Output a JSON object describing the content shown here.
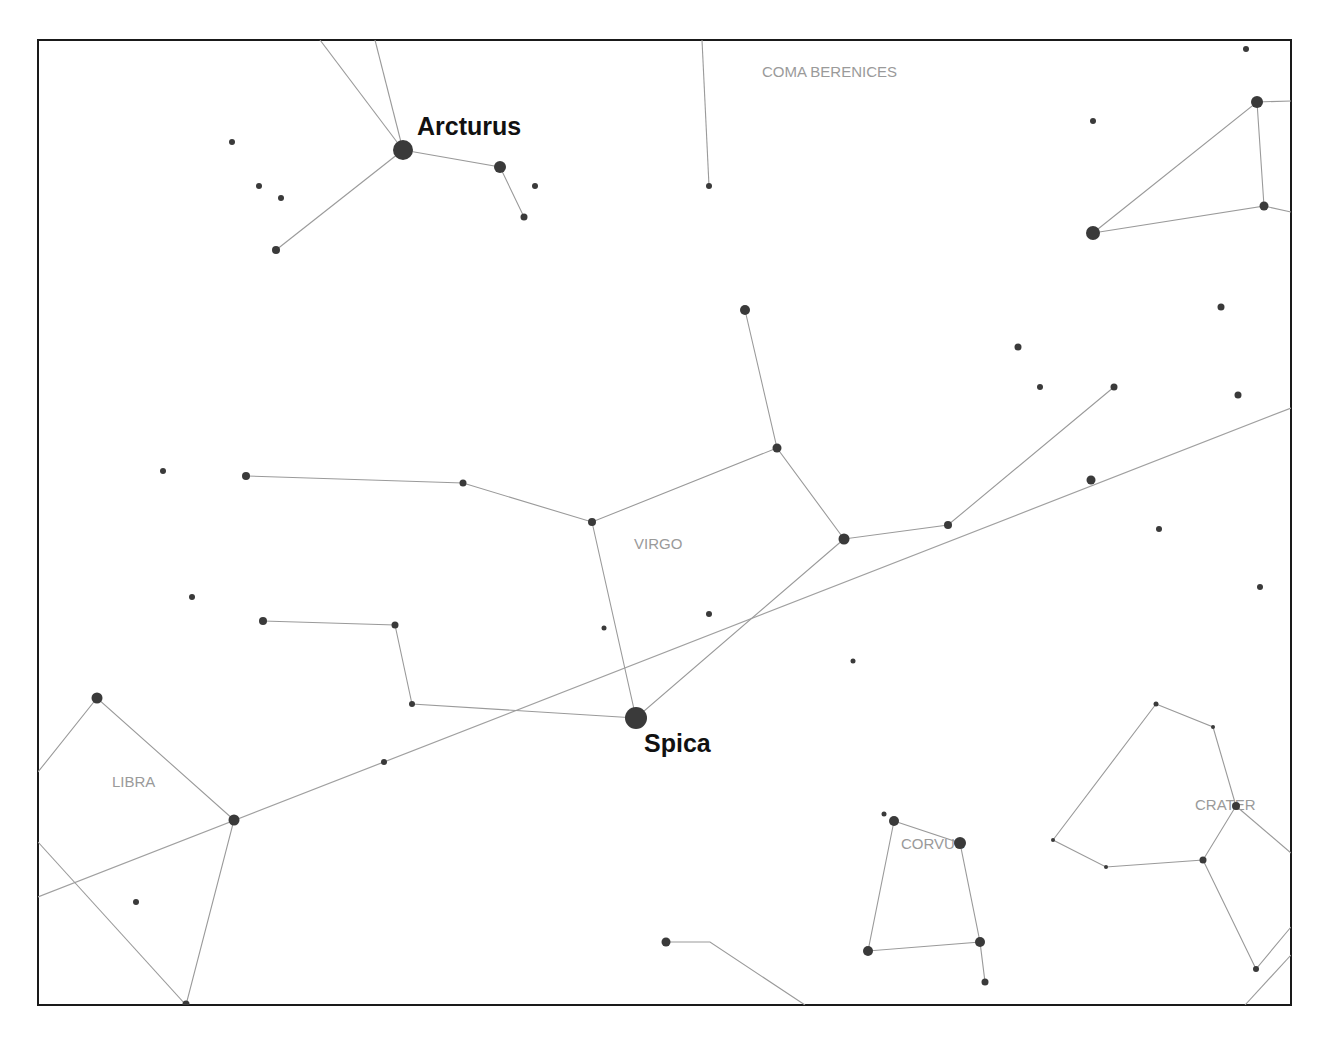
{
  "chart_data": {
    "type": "star-chart",
    "title": "",
    "frame": {
      "x": 38,
      "y": 40,
      "width": 1253,
      "height": 965
    },
    "constellation_labels": [
      {
        "name": "COMA BERENICES",
        "x": 762,
        "y": 77
      },
      {
        "name": "VIRGO",
        "x": 634,
        "y": 549
      },
      {
        "name": "LIBRA",
        "x": 112,
        "y": 787
      },
      {
        "name": "CORVUS",
        "x": 901,
        "y": 849
      },
      {
        "name": "CRATER",
        "x": 1195,
        "y": 810
      }
    ],
    "star_labels": [
      {
        "name": "Arcturus",
        "x": 417,
        "y": 135
      },
      {
        "name": "Spica",
        "x": 644,
        "y": 752
      }
    ],
    "stars": [
      {
        "id": "arcturus",
        "x": 403,
        "y": 150,
        "r": 10
      },
      {
        "x": 500,
        "y": 167,
        "r": 6
      },
      {
        "x": 524,
        "y": 217,
        "r": 3.5
      },
      {
        "x": 535,
        "y": 186,
        "r": 3
      },
      {
        "x": 276,
        "y": 250,
        "r": 4
      },
      {
        "x": 232,
        "y": 142,
        "r": 3
      },
      {
        "x": 259,
        "y": 186,
        "r": 3
      },
      {
        "x": 281,
        "y": 198,
        "r": 3
      },
      {
        "x": 709,
        "y": 186,
        "r": 3
      },
      {
        "x": 1093,
        "y": 233,
        "r": 7
      },
      {
        "x": 1257,
        "y": 102,
        "r": 6
      },
      {
        "x": 1264,
        "y": 206,
        "r": 4.5
      },
      {
        "x": 1093,
        "y": 121,
        "r": 3
      },
      {
        "x": 1246,
        "y": 49,
        "r": 3
      },
      {
        "x": 745,
        "y": 310,
        "r": 5
      },
      {
        "x": 777,
        "y": 448,
        "r": 4.5
      },
      {
        "x": 844,
        "y": 539,
        "r": 5.5
      },
      {
        "x": 948,
        "y": 525,
        "r": 4
      },
      {
        "x": 1114,
        "y": 387,
        "r": 3.5
      },
      {
        "x": 592,
        "y": 522,
        "r": 4
      },
      {
        "x": 463,
        "y": 483,
        "r": 3.5
      },
      {
        "x": 246,
        "y": 476,
        "r": 4
      },
      {
        "x": 163,
        "y": 471,
        "r": 3
      },
      {
        "x": 192,
        "y": 597,
        "r": 3
      },
      {
        "x": 263,
        "y": 621,
        "r": 4
      },
      {
        "x": 395,
        "y": 625,
        "r": 3.5
      },
      {
        "x": 412,
        "y": 704,
        "r": 3
      },
      {
        "id": "spica",
        "x": 636,
        "y": 718,
        "r": 11
      },
      {
        "x": 709,
        "y": 614,
        "r": 3
      },
      {
        "x": 604,
        "y": 628,
        "r": 2.5
      },
      {
        "x": 853,
        "y": 661,
        "r": 2.5
      },
      {
        "x": 384,
        "y": 762,
        "r": 3
      },
      {
        "x": 1018,
        "y": 347,
        "r": 3.5
      },
      {
        "x": 1040,
        "y": 387,
        "r": 3
      },
      {
        "x": 1221,
        "y": 307,
        "r": 3.5
      },
      {
        "x": 1238,
        "y": 395,
        "r": 3.5
      },
      {
        "x": 1091,
        "y": 480,
        "r": 4.5
      },
      {
        "x": 1159,
        "y": 529,
        "r": 3
      },
      {
        "x": 1260,
        "y": 587,
        "r": 3
      },
      {
        "x": 97,
        "y": 698,
        "r": 5.5
      },
      {
        "x": 234,
        "y": 820,
        "r": 5.5
      },
      {
        "x": 186,
        "y": 1004,
        "r": 3.5
      },
      {
        "x": 136,
        "y": 902,
        "r": 3
      },
      {
        "x": 666,
        "y": 942,
        "r": 4.5
      },
      {
        "x": 884,
        "y": 814,
        "r": 2.5
      },
      {
        "x": 894,
        "y": 821,
        "r": 5
      },
      {
        "x": 960,
        "y": 843,
        "r": 6
      },
      {
        "x": 868,
        "y": 951,
        "r": 5
      },
      {
        "x": 980,
        "y": 942,
        "r": 5
      },
      {
        "x": 985,
        "y": 982,
        "r": 3.5
      },
      {
        "x": 1156,
        "y": 704,
        "r": 2.5
      },
      {
        "x": 1213,
        "y": 727,
        "r": 2
      },
      {
        "x": 1236,
        "y": 806,
        "r": 4
      },
      {
        "x": 1053,
        "y": 840,
        "r": 2
      },
      {
        "x": 1106,
        "y": 867,
        "r": 2
      },
      {
        "x": 1203,
        "y": 860,
        "r": 3.5
      },
      {
        "x": 1256,
        "y": 969,
        "r": 3
      }
    ],
    "lines": [
      [
        [
          320,
          40
        ],
        [
          403,
          150
        ]
      ],
      [
        [
          375,
          40
        ],
        [
          403,
          150
        ]
      ],
      [
        [
          403,
          150
        ],
        [
          500,
          167
        ],
        [
          524,
          217
        ]
      ],
      [
        [
          403,
          150
        ],
        [
          276,
          250
        ]
      ],
      [
        [
          702,
          40
        ],
        [
          709,
          186
        ]
      ],
      [
        [
          1093,
          233
        ],
        [
          1257,
          102
        ],
        [
          1264,
          206
        ],
        [
          1093,
          233
        ]
      ],
      [
        [
          1257,
          102
        ],
        [
          1291,
          101
        ]
      ],
      [
        [
          1264,
          206
        ],
        [
          1291,
          212
        ]
      ],
      [
        [
          745,
          310
        ],
        [
          777,
          448
        ],
        [
          844,
          539
        ],
        [
          948,
          525
        ],
        [
          1114,
          387
        ]
      ],
      [
        [
          777,
          448
        ],
        [
          592,
          522
        ],
        [
          463,
          483
        ],
        [
          246,
          476
        ]
      ],
      [
        [
          592,
          522
        ],
        [
          636,
          718
        ],
        [
          844,
          539
        ]
      ],
      [
        [
          263,
          621
        ],
        [
          395,
          625
        ],
        [
          412,
          704
        ],
        [
          636,
          718
        ]
      ],
      [
        [
          38,
          772
        ],
        [
          97,
          698
        ],
        [
          234,
          820
        ],
        [
          186,
          1005
        ]
      ],
      [
        [
          38,
          842
        ],
        [
          186,
          1005
        ]
      ],
      [
        [
          666,
          942
        ],
        [
          710,
          942
        ],
        [
          805,
          1005
        ]
      ],
      [
        [
          894,
          821
        ],
        [
          960,
          843
        ],
        [
          980,
          942
        ],
        [
          868,
          951
        ],
        [
          894,
          821
        ]
      ],
      [
        [
          980,
          942
        ],
        [
          985,
          982
        ]
      ],
      [
        [
          1156,
          704
        ],
        [
          1213,
          727
        ],
        [
          1236,
          806
        ],
        [
          1203,
          860
        ],
        [
          1106,
          867
        ],
        [
          1053,
          840
        ],
        [
          1156,
          704
        ]
      ],
      [
        [
          1236,
          806
        ],
        [
          1291,
          853
        ]
      ],
      [
        [
          1203,
          860
        ],
        [
          1256,
          969
        ],
        [
          1291,
          927
        ]
      ],
      [
        [
          1245,
          1005
        ],
        [
          1291,
          955
        ]
      ]
    ],
    "ecliptic": [
      [
        38,
        897
      ],
      [
        1291,
        408
      ]
    ]
  }
}
